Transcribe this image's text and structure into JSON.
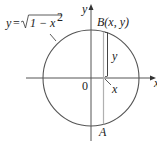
{
  "diagram": {
    "equation_label": {
      "lhs": "y",
      "eq": "=",
      "radicand": "1 − x",
      "exponent": "2"
    },
    "point_B_label": "B(x, y)",
    "point_A_label": "A",
    "origin_label": "0",
    "x_axis_label": "x",
    "y_axis_label": "y",
    "x_marker_label": "x",
    "y_height_label": "y",
    "colors": {
      "stroke": "#444444",
      "strip": "#b0b0b0",
      "text": "#222222"
    }
  }
}
